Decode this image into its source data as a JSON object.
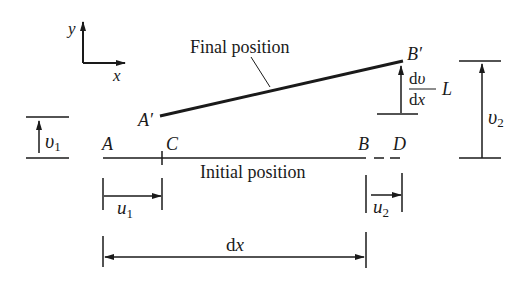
{
  "diagram": {
    "axes": {
      "x_label": "x",
      "y_label": "y"
    },
    "final_position": {
      "label": "Final position",
      "start_label": "A′",
      "end_label": "B′"
    },
    "initial_position": {
      "label": "Initial position",
      "point_a": "A",
      "point_c": "C",
      "point_b": "B",
      "point_d": "D"
    },
    "dimensions": {
      "v1": {
        "symbol": "υ",
        "sub": "1"
      },
      "v2": {
        "symbol": "υ",
        "sub": "2"
      },
      "u1": {
        "symbol": "u",
        "sub": "1"
      },
      "u2": {
        "symbol": "u",
        "sub": "2"
      },
      "dx": {
        "d": "d",
        "x": "x"
      },
      "slope": {
        "num_d": "d",
        "num_v": "υ",
        "den_d": "d",
        "den_x": "x",
        "factor": "L"
      }
    },
    "colors": {
      "ink": "#1a1a1a",
      "background": "#ffffff"
    }
  }
}
